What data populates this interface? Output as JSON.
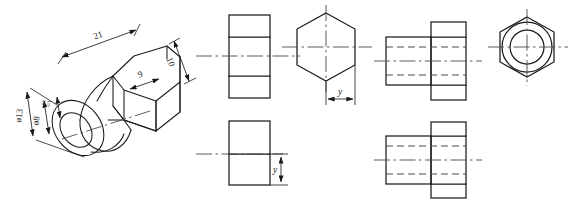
{
  "drawing": {
    "title": "Hexagonal bushing — isometric and orthographic projections",
    "background_color": "#ffffff",
    "line_color": "#1a1a1a",
    "hidden_line_color": "#4a4a4a",
    "center_line_color": "#4a4a4a"
  },
  "isometric": {
    "label": "isometric-pictorial-view",
    "dimensions": [
      {
        "id": "len-21",
        "text": "21",
        "meaning": "overall length"
      },
      {
        "id": "len-10",
        "text": "10",
        "meaning": "hex head thickness"
      },
      {
        "id": "len-9",
        "text": "9",
        "meaning": "across flats / step"
      },
      {
        "id": "dia-13",
        "text": "ø13",
        "meaning": "outer diameter"
      },
      {
        "id": "dia-8",
        "text": "ø8",
        "meaning": "bore diameter"
      }
    ],
    "tolerance_note": {
      "upper": "+0.2",
      "lower": "-0.1"
    }
  },
  "views": {
    "front_top": {
      "name": "front-view-top",
      "description": "Stepped rectangle with two horizontal division lines and horizontal centerline"
    },
    "front_bottom": {
      "name": "front-view-bottom",
      "description": "Rectangle with horizontal division line and vertical dimension y",
      "dimension": {
        "id": "y-vertical",
        "text": "y"
      }
    },
    "hex_middle": {
      "name": "hexagon-view",
      "description": "Regular hexagon with vertical and horizontal centerlines",
      "dimension": {
        "id": "y-horizontal",
        "text": "y"
      }
    },
    "section_top": {
      "name": "section-view-top",
      "description": "Stepped cylindrical body with hidden bore lines and centerline"
    },
    "section_bottom": {
      "name": "section-view-bottom",
      "description": "Stepped cylindrical body with hidden bore lines and centerline"
    },
    "end_view": {
      "name": "end-view-hexagon-with-bore",
      "description": "Hexagon outline with two concentric circles and crossed centerlines"
    }
  },
  "faint_header": {
    "visible": true,
    "fragments": [
      "",
      "",
      "",
      "",
      "",
      ""
    ]
  }
}
